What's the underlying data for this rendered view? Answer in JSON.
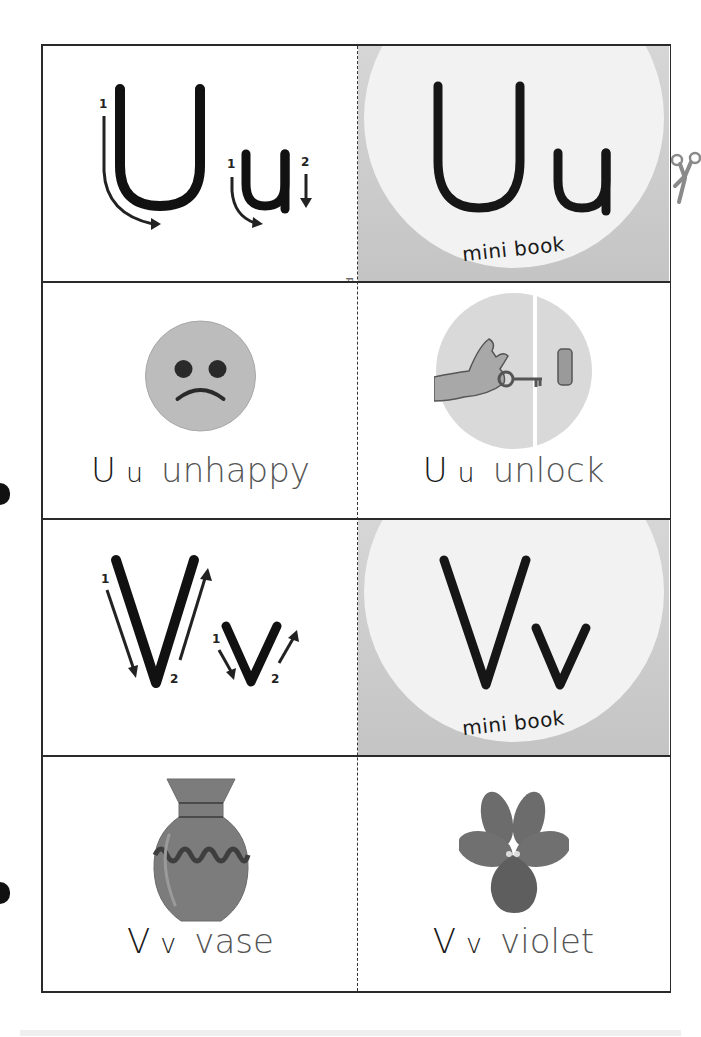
{
  "page": {
    "fold_label": "fold",
    "colors": {
      "border": "#2a2a2a",
      "book_bg": "#cfcfcf",
      "book_circle": "#f2f2f2",
      "ink": "#1a1a1a",
      "word_gray": "#555555",
      "picture_gray": "#b8b8b8"
    }
  },
  "rows": [
    {
      "left": {
        "type": "tracing",
        "letters": "Uu",
        "upper": "U",
        "lower": "u",
        "stroke_numbers_upper": [
          "1"
        ],
        "stroke_numbers_lower": [
          "1",
          "2"
        ]
      },
      "right": {
        "type": "mini-book-cover",
        "letters": "Uu",
        "caption": "mini book"
      }
    },
    {
      "left": {
        "type": "word-card",
        "upper": "U",
        "lower": "u",
        "word": "unhappy",
        "picture": "sad-face"
      },
      "right": {
        "type": "word-card",
        "upper": "U",
        "lower": "u",
        "word": "unlock",
        "picture": "hand-key-door"
      }
    },
    {
      "left": {
        "type": "tracing",
        "letters": "Vv",
        "upper": "V",
        "lower": "v",
        "stroke_numbers_upper": [
          "1",
          "2"
        ],
        "stroke_numbers_lower": [
          "1",
          "2"
        ]
      },
      "right": {
        "type": "mini-book-cover",
        "letters": "Vv",
        "caption": "mini book"
      }
    },
    {
      "left": {
        "type": "word-card",
        "upper": "V",
        "lower": "v",
        "word": "vase",
        "picture": "vase"
      },
      "right": {
        "type": "word-card",
        "upper": "V",
        "lower": "v",
        "word": "violet",
        "picture": "violet-flower"
      }
    }
  ]
}
